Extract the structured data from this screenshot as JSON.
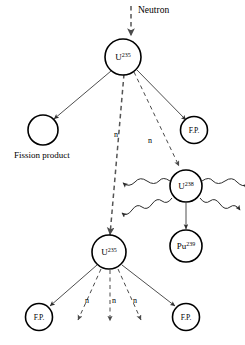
{
  "diagram": {
    "background_color": "#ffffff",
    "line_color": "#333333",
    "width": 245,
    "height": 345,
    "incoming": {
      "label": "Neutron",
      "marker": "dashed-arrow-down"
    },
    "nodes": {
      "u235_top": {
        "element": "U",
        "mass_number": "235",
        "label": "U235"
      },
      "fission_product_left": {
        "label": "",
        "caption": "Fission product"
      },
      "fp_right_top": {
        "label": "F.P."
      },
      "u238": {
        "element": "U",
        "mass_number": "238",
        "label": "U238"
      },
      "pu239": {
        "element": "Pu",
        "mass_number": "239",
        "label": "Pu239"
      },
      "u235_second": {
        "element": "U",
        "mass_number": "235",
        "label": "U235"
      },
      "fp_bottom_left": {
        "label": "F.P."
      },
      "fp_bottom_right": {
        "label": "F.P."
      }
    },
    "neutron_labels": {
      "n1": "n",
      "n2": "n",
      "n3": "n",
      "n4": "n",
      "n5": "n"
    },
    "captions": {
      "fission_product": "Fission product"
    },
    "legend_notes": {
      "solid_arrow": "fission product emission",
      "dashed_arrow": "neutron path",
      "wavy_arrow": "gamma radiation"
    }
  }
}
